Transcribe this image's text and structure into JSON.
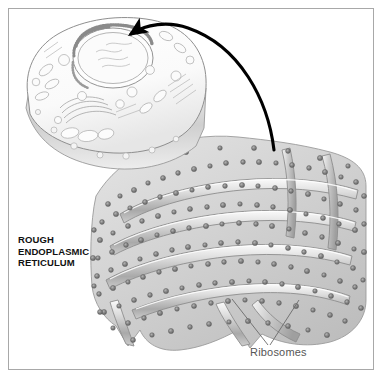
{
  "figure": {
    "title": "Rough Endoplasmic Reticulum",
    "background_color": "#ffffff",
    "border_color": "#a8a8a8"
  },
  "labels": {
    "rough_er": {
      "line1": "ROUGH",
      "line2": "ENDOPLASMIC",
      "line3": "RETICULUM",
      "text": "ROUGH\nENDOPLASMIC\nRETICULUM",
      "color": "#111111"
    },
    "ribosomes": {
      "text": "Ribosomes",
      "color": "#565656"
    }
  },
  "structures": {
    "cell": {
      "name": "animal-cell-cutaway",
      "outline_color": "#9a9a9a",
      "fill_color": "#fbfbfb"
    },
    "nucleus": {
      "name": "nucleus",
      "outline_color": "#8d8d8d"
    },
    "golgi": {
      "name": "golgi-apparatus",
      "outline_color": "#9a9a9a"
    },
    "magnified_er": {
      "name": "rough-endoplasmic-reticulum-magnified",
      "membrane_color": "#8a8a8a",
      "lumen_color": "#c9c9c9",
      "ribosome_color": "#6b6b6b"
    },
    "arrow": {
      "name": "magnification-arrow",
      "color": "#000000",
      "description": "curved arrow from magnified rough ER to the nuclear envelope"
    },
    "leader_lines": {
      "name": "ribosome-leader-lines",
      "color": "#6a6a6a",
      "count": 2
    }
  }
}
